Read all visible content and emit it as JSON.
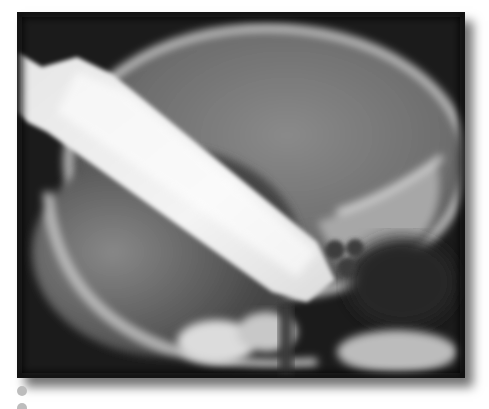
{
  "figure": {
    "kind": "radiograph",
    "view": "lateral skull X-ray",
    "palette": {
      "background": "#1a1a1a",
      "bone": "#d8d8d8",
      "soft_tissue": "#7a7a7a",
      "foreign_object": "#f2f2f2",
      "page": "#ffffff",
      "bullet": "#bdbdbd"
    }
  },
  "bullets": [
    {
      "id": "bullet-1"
    },
    {
      "id": "bullet-2"
    }
  ]
}
